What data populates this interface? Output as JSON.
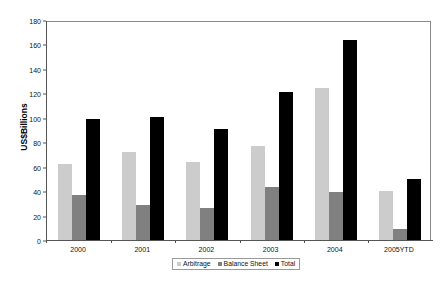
{
  "chart_data": {
    "type": "bar",
    "title": "",
    "xlabel": "",
    "ylabel": "US$Billions",
    "ylim": [
      0,
      180
    ],
    "ytick_step": 20,
    "yticks": [
      "180",
      "160",
      "140",
      "120",
      "100",
      "80",
      "60",
      "40",
      "20",
      "0"
    ],
    "grid": false,
    "legend_position": "bottom-center",
    "categories": [
      "2000",
      "2001",
      "2002",
      "2003",
      "2004",
      "2005YTD"
    ],
    "series": [
      {
        "name": "Arbitrage",
        "color": "#cccccc",
        "values": [
          62,
          72,
          64,
          77,
          124,
          40
        ]
      },
      {
        "name": "Balance Sheet",
        "color": "#808080",
        "values": [
          37,
          29,
          26,
          43,
          39,
          9
        ]
      },
      {
        "name": "Total",
        "color": "#000000",
        "values": [
          99,
          101,
          91,
          121,
          164,
          50
        ]
      }
    ]
  },
  "legend": {
    "items": [
      {
        "label": "Arbitrage",
        "swatch": "arbitrage"
      },
      {
        "label": "Balance Sheet",
        "swatch": "balancesheet"
      },
      {
        "label": "Total",
        "swatch": "total"
      }
    ]
  },
  "axis": {
    "y_title": "US$Billions"
  }
}
